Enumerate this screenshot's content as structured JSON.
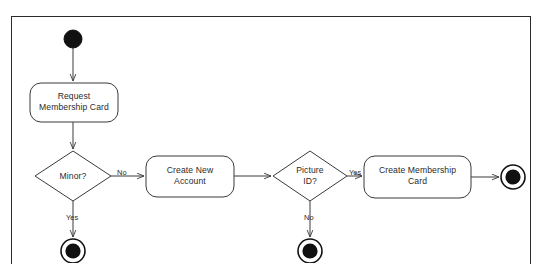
{
  "figure": {
    "type": "uml-activity-diagram",
    "cut_off_caption_above": "",
    "frame": {
      "border_color": "#2b2b2b",
      "background": "#ffffff"
    },
    "stroke_color": "#3a3a3a",
    "fill_color": "#ffffff",
    "text_color": "#2a2a2a"
  },
  "nodes": [
    {
      "id": "start",
      "kind": "initial-node",
      "name": "initial-node",
      "label": "",
      "cx": 61,
      "cy": 22,
      "r": 9
    },
    {
      "id": "request-membership-card",
      "kind": "action",
      "name": "action-request-membership-card",
      "label": "Request\nMembership Card",
      "x": 18,
      "y": 66,
      "w": 88,
      "h": 39
    },
    {
      "id": "minor",
      "kind": "decision",
      "name": "decision-minor",
      "label": "Minor?",
      "cx": 61,
      "cy": 159,
      "rx": 38,
      "ry": 25
    },
    {
      "id": "create-new-account",
      "kind": "action",
      "name": "action-create-new-account",
      "label": "Create New\nAccount",
      "x": 134,
      "y": 139,
      "w": 88,
      "h": 41
    },
    {
      "id": "picture-id",
      "kind": "decision",
      "name": "decision-picture-id",
      "label": "Picture\nID?",
      "cx": 298,
      "cy": 159,
      "rx": 37,
      "ry": 25
    },
    {
      "id": "create-membership-card",
      "kind": "action",
      "name": "action-create-membership-card",
      "label": "Create Membership\nCard",
      "x": 352,
      "y": 139,
      "w": 107,
      "h": 42
    },
    {
      "id": "final-right",
      "kind": "final-node",
      "name": "final-node-success",
      "label": "",
      "cx": 501,
      "cy": 160,
      "r": 12
    },
    {
      "id": "final-minor-yes",
      "kind": "final-node",
      "name": "final-node-minor-yes",
      "label": "",
      "cx": 61,
      "cy": 234,
      "r": 12
    },
    {
      "id": "final-picture-no",
      "kind": "final-node",
      "name": "final-node-picture-id-no",
      "label": "",
      "cx": 298,
      "cy": 234,
      "r": 12
    }
  ],
  "edges": [
    {
      "id": "e1",
      "name": "edge-start-to-request",
      "from": "start",
      "to": "request-membership-card",
      "label": "",
      "label_x": 0,
      "label_y": 0
    },
    {
      "id": "e2",
      "name": "edge-request-to-minor",
      "from": "request-membership-card",
      "to": "minor",
      "label": "",
      "label_x": 0,
      "label_y": 0
    },
    {
      "id": "e3",
      "name": "edge-minor-no-to-account",
      "from": "minor",
      "to": "create-new-account",
      "label": "No",
      "label_x": 105,
      "label_y": 152
    },
    {
      "id": "e4",
      "name": "edge-minor-yes-to-final",
      "from": "minor",
      "to": "final-minor-yes",
      "label": "Yes",
      "label_x": 54,
      "label_y": 197
    },
    {
      "id": "e5",
      "name": "edge-account-to-picture-id",
      "from": "create-new-account",
      "to": "picture-id",
      "label": "",
      "label_x": 0,
      "label_y": 0
    },
    {
      "id": "e6",
      "name": "edge-picture-yes-to-create",
      "from": "picture-id",
      "to": "create-membership-card",
      "label": "Yes",
      "label_x": 337,
      "label_y": 152
    },
    {
      "id": "e7",
      "name": "edge-picture-no-to-final",
      "from": "picture-id",
      "to": "final-picture-no",
      "label": "No",
      "label_x": 292,
      "label_y": 197
    },
    {
      "id": "e8",
      "name": "edge-create-card-to-final",
      "from": "create-membership-card",
      "to": "final-right",
      "label": "",
      "label_x": 0,
      "label_y": 0
    }
  ]
}
